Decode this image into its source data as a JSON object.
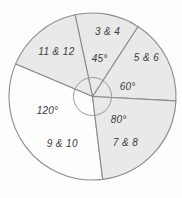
{
  "chart_data": {
    "type": "pie",
    "title": "",
    "segments": [
      {
        "label": "3 & 4",
        "angle_label": "45°",
        "degrees": 45,
        "shaded": true
      },
      {
        "label": "5 & 6",
        "angle_label": "60°",
        "degrees": 60,
        "shaded": true
      },
      {
        "label": "7 & 8",
        "angle_label": "80°",
        "degrees": 80,
        "shaded": true
      },
      {
        "label": "9 & 10",
        "angle_label": "120°",
        "degrees": 120,
        "shaded": false
      },
      {
        "label": "11 & 12",
        "angle_label": "",
        "degrees": 55,
        "shaded": true
      }
    ],
    "colors": {
      "shaded_fill": "#e9e9e9",
      "unshaded_fill": "#fdfdfd",
      "stroke": "#8c8c8c",
      "inner_circle_stroke": "#9a9a9a",
      "label_text": "#3b3b3b"
    },
    "center_angle_circle": true,
    "legend_position": "none",
    "grid": false
  }
}
